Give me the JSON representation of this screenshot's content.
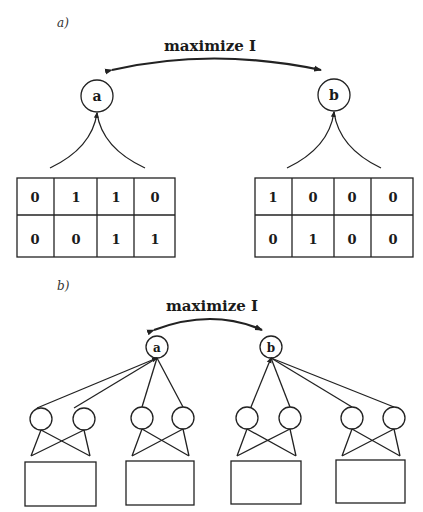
{
  "panel_a": {
    "label": "a)",
    "objective": "maximize I",
    "node_left": "a",
    "node_right": "b",
    "table_left": [
      [
        "0",
        "1",
        "1",
        "0"
      ],
      [
        "0",
        "0",
        "1",
        "1"
      ]
    ],
    "table_right": [
      [
        "1",
        "0",
        "0",
        "0"
      ],
      [
        "0",
        "1",
        "0",
        "0"
      ]
    ]
  },
  "panel_b": {
    "label": "b)",
    "objective": "maximize I",
    "node_left": "a",
    "node_right": "b",
    "hidden_groups": 4,
    "hidden_units_per_group": 2
  }
}
